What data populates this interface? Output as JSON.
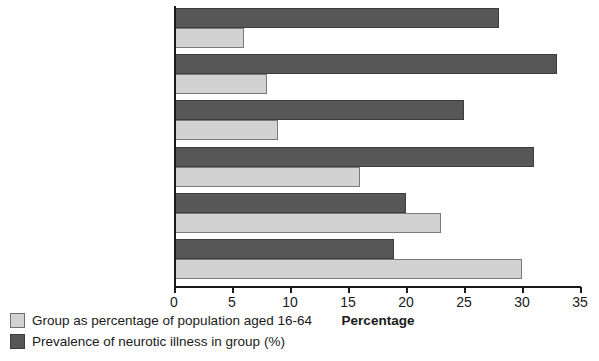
{
  "chart_data": {
    "type": "bar",
    "orientation": "horizontal",
    "title": "",
    "xlabel": "Percentage",
    "ylabel": "",
    "xlim": [
      0,
      35
    ],
    "xticks": [
      0,
      5,
      10,
      15,
      20,
      25,
      30,
      35
    ],
    "grid": false,
    "legend_position": "below-left",
    "categories": [
      "Lone parent",
      "2+ physical illnesses",
      "Unemployed",
      "People with disabilities",
      "Economically inactive",
      "Left school at age 15\nor under"
    ],
    "series": [
      {
        "name": "Prevalence of neurotic illness in group (%)",
        "color": "#575757",
        "values": [
          28,
          33,
          25,
          31,
          20,
          19
        ]
      },
      {
        "name": "Group as percentage of population aged 16-64",
        "color": "#d2d2d2",
        "values": [
          6,
          8,
          9,
          16,
          23,
          30
        ]
      }
    ]
  },
  "legend": {
    "items": [
      {
        "label": "Group as percentage of population aged 16-64",
        "swatch": "light"
      },
      {
        "label": "Prevalence of neurotic illness in group (%)",
        "swatch": "dark"
      }
    ]
  },
  "colors": {
    "dark_bar": "#575757",
    "light_bar": "#d2d2d2",
    "axis": "#1a1a1a",
    "background": "#ffffff"
  }
}
